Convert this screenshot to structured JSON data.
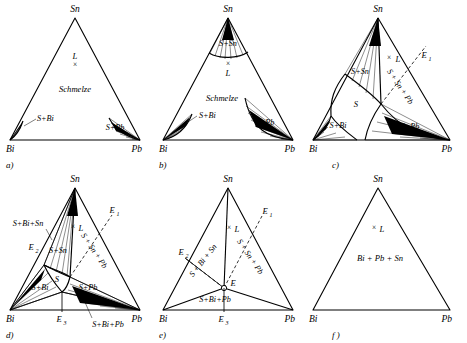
{
  "figure": {
    "system": "Bi + Pb + Sn",
    "line_color": "#000000",
    "background": "#ffffff",
    "corner_labels": {
      "top": "Sn",
      "left": "Bi",
      "right": "Pb"
    }
  },
  "panels": [
    {
      "id": "a",
      "caption": "a)",
      "corners": {
        "top": "Sn",
        "left": "Bi",
        "right": "Pb"
      },
      "regions": [
        {
          "name": "melt",
          "label": "Schmelze"
        },
        {
          "name": "liquid-point",
          "label": "L"
        },
        {
          "name": "solid-bi",
          "label": "S+Bi"
        },
        {
          "name": "solid-pb",
          "label": "S+Pb"
        }
      ],
      "points": [
        {
          "name": "L",
          "marker": "x"
        }
      ]
    },
    {
      "id": "b",
      "caption": "b)",
      "corners": {
        "top": "Sn",
        "left": "Bi",
        "right": "Pb"
      },
      "regions": [
        {
          "name": "melt",
          "label": "Schmelze"
        },
        {
          "name": "liquid-point",
          "label": "L"
        },
        {
          "name": "solid-sn",
          "label": "S+Sn"
        },
        {
          "name": "solid-bi",
          "label": "S+Bi"
        },
        {
          "name": "solid-pb",
          "label": "S+Pb"
        }
      ],
      "points": [
        {
          "name": "L",
          "marker": "x"
        }
      ]
    },
    {
      "id": "c",
      "caption": "c)",
      "corners": {
        "top": "Sn",
        "left": "Bi",
        "right": "Pb"
      },
      "regions": [
        {
          "name": "liquid-point",
          "label": "L"
        },
        {
          "name": "solid-sn",
          "label": "S+Sn"
        },
        {
          "name": "solid-bi",
          "label": "S+Bi"
        },
        {
          "name": "solid-pb",
          "label": "S+Pb"
        },
        {
          "name": "solid",
          "label": "S"
        },
        {
          "name": "solid-sn-pb",
          "label": "S + Sn + Pb"
        }
      ],
      "points": [
        {
          "name": "L",
          "marker": "x"
        },
        {
          "name": "E1",
          "label": "E",
          "sub": "1"
        }
      ]
    },
    {
      "id": "d",
      "caption": "d)",
      "corners": {
        "top": "Sn",
        "left": "Bi",
        "right": "Pb"
      },
      "regions": [
        {
          "name": "liquid-point",
          "label": "L"
        },
        {
          "name": "solid-bi-sn",
          "label": "S+Bi+Sn"
        },
        {
          "name": "solid-sn",
          "label": "S+Sn"
        },
        {
          "name": "solid-bi",
          "label": "S+Bi"
        },
        {
          "name": "solid-pb",
          "label": "S+Pb"
        },
        {
          "name": "solid",
          "label": "S"
        },
        {
          "name": "solid-sn-pb",
          "label": "S + Sn + Pb"
        },
        {
          "name": "solid-bi-pb",
          "label": "S+Bi+Pb"
        }
      ],
      "points": [
        {
          "name": "L",
          "marker": "x"
        },
        {
          "name": "E1",
          "label": "E",
          "sub": "1"
        },
        {
          "name": "E2",
          "label": "E",
          "sub": "2"
        },
        {
          "name": "E3",
          "label": "E",
          "sub": "3"
        }
      ]
    },
    {
      "id": "e",
      "caption": "e)",
      "corners": {
        "top": "Sn",
        "left": "Bi",
        "right": "Pb"
      },
      "regions": [
        {
          "name": "liquid-point",
          "label": "L"
        },
        {
          "name": "solid-bi-sn",
          "label": "S + Bi + Sn"
        },
        {
          "name": "solid-sn-pb",
          "label": "S + Sn + Pb"
        },
        {
          "name": "solid-bi-pb",
          "label": "S+Bi+Pb"
        }
      ],
      "points": [
        {
          "name": "L",
          "marker": "x"
        },
        {
          "name": "E1",
          "label": "E",
          "sub": "1"
        },
        {
          "name": "E2",
          "label": "E",
          "sub": "2"
        },
        {
          "name": "E3",
          "label": "E",
          "sub": "3"
        },
        {
          "name": "E-center",
          "label": "E"
        }
      ]
    },
    {
      "id": "f",
      "caption": "f )",
      "corners": {
        "top": "Sn",
        "left": "Bi",
        "right": "Pb"
      },
      "regions": [
        {
          "name": "liquid-point",
          "label": "L"
        },
        {
          "name": "solid-all",
          "label": "Bi + Pb + Sn"
        }
      ],
      "points": [
        {
          "name": "L",
          "marker": "x"
        }
      ]
    }
  ]
}
